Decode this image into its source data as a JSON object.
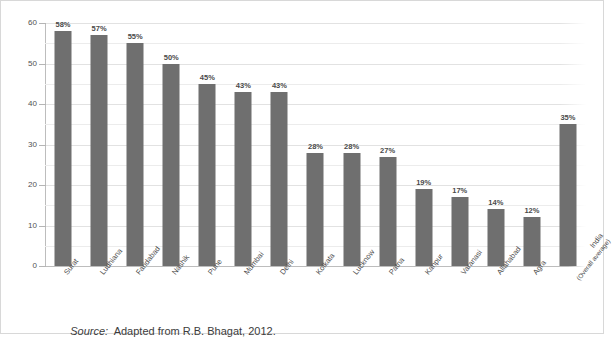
{
  "figure": {
    "source_prefix": "Source:",
    "source_text": "  Adapted from R.B. Bhagat, 2012."
  },
  "colors": {
    "bar": "#6f6f6f",
    "gridline": "#ececec",
    "axis": "#bdbdbd",
    "text": "#4a4a4a",
    "background": "#ffffff"
  },
  "chart_data": {
    "type": "bar",
    "title": "",
    "subtitle": "",
    "xlabel": "",
    "ylabel": "",
    "ylim": [
      0,
      60
    ],
    "yticks": [
      0,
      10,
      20,
      30,
      40,
      50,
      60
    ],
    "ytick_labels": [
      "0",
      "10",
      "20",
      "30",
      "40",
      "50",
      "60"
    ],
    "minor_tick_step": 5,
    "grid": true,
    "grid_axis": "y",
    "legend": false,
    "legend_position": "none",
    "value_suffix": "%",
    "categories": [
      "Surat",
      "Ludhiana",
      "Faridabad",
      "Nashik",
      "Pune",
      "Mumbai",
      "Delhi",
      "Kolkata",
      "Lucknow",
      "Patna",
      "Kanpur",
      "Varanasi",
      "Allahabad",
      "Agra",
      "India (Overall average)"
    ],
    "category_lines": [
      [
        "Surat"
      ],
      [
        "Ludhiana"
      ],
      [
        "Faridabad"
      ],
      [
        "Nashik"
      ],
      [
        "Pune"
      ],
      [
        "Mumbai"
      ],
      [
        "Delhi"
      ],
      [
        "Kolkata"
      ],
      [
        "Lucknow"
      ],
      [
        "Patna"
      ],
      [
        "Kanpur"
      ],
      [
        "Varanasi"
      ],
      [
        "Allahabad"
      ],
      [
        "Agra"
      ],
      [
        "India",
        "(Overall average)"
      ]
    ],
    "values": [
      58,
      57,
      55,
      50,
      45,
      43,
      43,
      28,
      28,
      27,
      19,
      17,
      14,
      12,
      35
    ],
    "data_labels": [
      "58%",
      "57%",
      "55%",
      "50%",
      "45%",
      "43%",
      "43%",
      "28%",
      "28%",
      "27%",
      "19%",
      "17%",
      "14%",
      "12%",
      "35%"
    ]
  }
}
